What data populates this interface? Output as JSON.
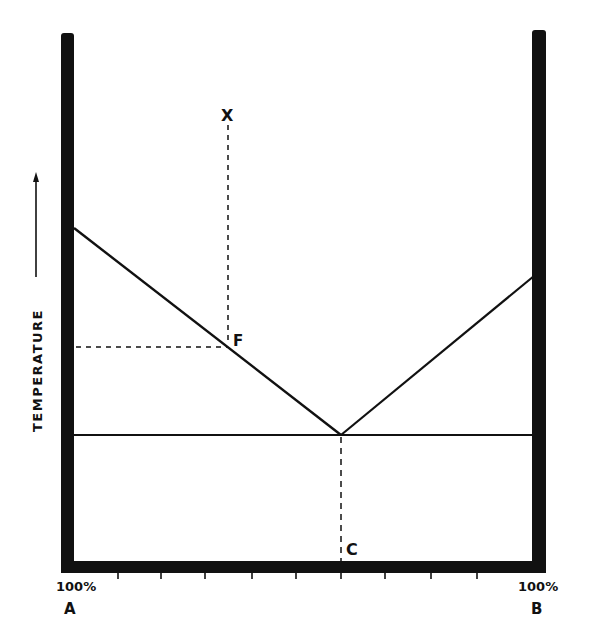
{
  "diagram": {
    "type": "eutectic-phase-diagram",
    "y_axis_label": "Temperature",
    "y_axis_label_display": "TEMPERATURE",
    "x_left_label_pct": "100%",
    "x_left_label_name": "A",
    "x_right_label_pct": "100%",
    "x_right_label_name": "B",
    "point_x_label": "X",
    "point_f_label": "F",
    "point_c_label": "C",
    "tick_count": 9,
    "line_color": "#111111",
    "background": "#ffffff"
  }
}
